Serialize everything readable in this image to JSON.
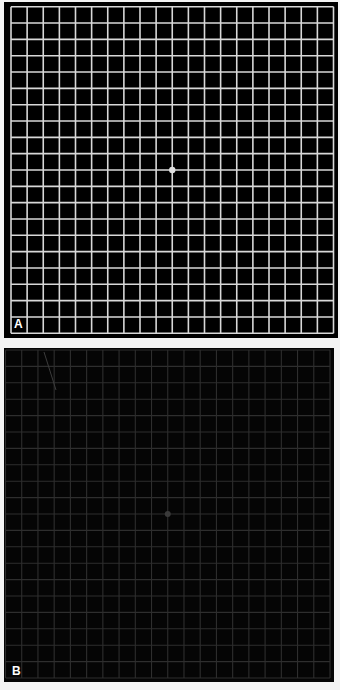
{
  "figure": {
    "panels": [
      {
        "id": "A",
        "label": "A",
        "description": "Amsler grid, high contrast white lines on black with central fixation dot",
        "grid_cells": 20,
        "line_color": "#d8d8d8",
        "background_color": "#000000",
        "fixation_dot_color": "#e0e0e0"
      },
      {
        "id": "B",
        "label": "B",
        "description": "Amsler grid, low contrast dim gray lines on black with faint central fixation dot",
        "grid_cells": 20,
        "line_color": "#2e2e2e",
        "background_color": "#050505",
        "fixation_dot_color": "#3a3a3a"
      }
    ]
  }
}
